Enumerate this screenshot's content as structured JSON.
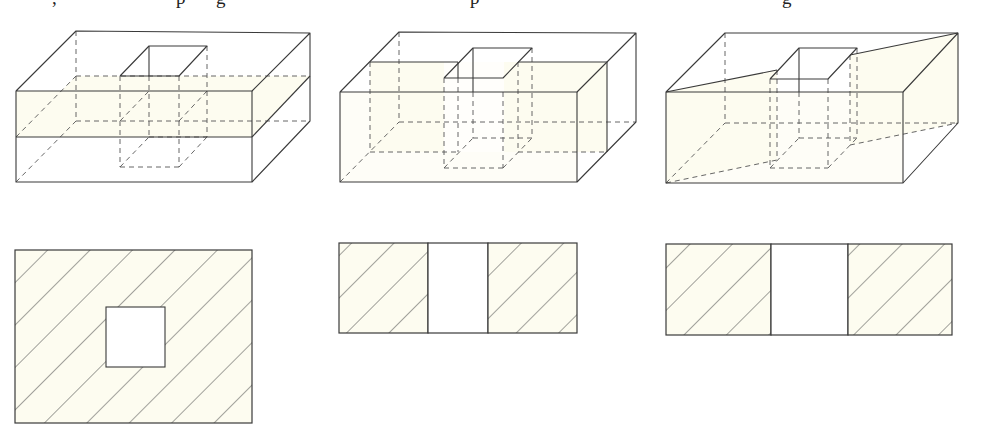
{
  "caption": {
    "clipped": true,
    "visible_fragments": [
      {
        "text": ",",
        "x": 52
      },
      {
        "text": "p",
        "x": 176
      },
      {
        "text": "g",
        "x": 216
      },
      {
        "text": "p",
        "x": 470
      },
      {
        "text": "g",
        "x": 782
      }
    ]
  },
  "colors": {
    "line": "#3a3a3a",
    "dash": "#555555",
    "section_fill": "#fdfcf0",
    "background": "#ffffff"
  },
  "figures": [
    {
      "id": "solid-1",
      "description": "Rectangular block with square through-hole, cut by horizontal plane",
      "cut_plane": "horizontal"
    },
    {
      "id": "solid-2",
      "description": "Rectangular block with square through-hole, cut by vertical plane parallel to front face",
      "cut_plane": "vertical-frontal"
    },
    {
      "id": "solid-3",
      "description": "Rectangular block with square through-hole, cut by oblique vertical plane",
      "cut_plane": "vertical-oblique"
    }
  ],
  "sections": [
    {
      "id": "section-1",
      "shape": "rectangle with square hole",
      "hatched": true
    },
    {
      "id": "section-2",
      "shape": "two hatched rectangles separated by a gap",
      "hatched": true
    },
    {
      "id": "section-3",
      "shape": "two hatched rectangles separated by a gap",
      "hatched": true
    }
  ]
}
